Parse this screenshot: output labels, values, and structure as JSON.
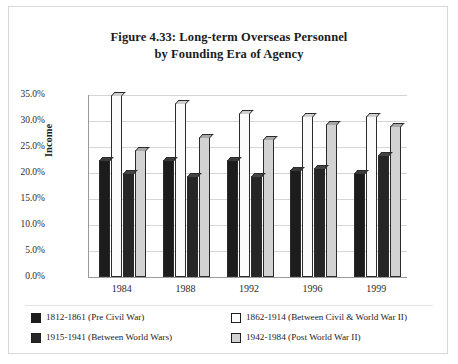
{
  "figure": {
    "title_line1": "Figure 4.33: Long-term Overseas Personnel",
    "title_line2": "by Founding Era of Agency"
  },
  "chart_data": {
    "type": "bar",
    "title": "Figure 4.33: Long-term Overseas Personnel by Founding Era of Agency",
    "xlabel": "",
    "ylabel": "Income",
    "ylim": [
      0,
      35
    ],
    "ytick_labels": [
      "0.0%",
      "5.0%",
      "10.0%",
      "15.0%",
      "20.0%",
      "25.0%",
      "30.0%",
      "35.0%"
    ],
    "ytick_values": [
      0,
      5,
      10,
      15,
      20,
      25,
      30,
      35
    ],
    "grid": true,
    "legend_position": "bottom",
    "categories": [
      "1984",
      "1988",
      "1992",
      "1996",
      "1999"
    ],
    "series": [
      {
        "name": "1812-1861 (Pre Civil War)",
        "color": "#1c1c1c",
        "values": [
          22.5,
          22.5,
          22.5,
          20.5,
          20.0
        ]
      },
      {
        "name": "1862-1914 (Between Civil & World War II)",
        "color": "#fbfbfb",
        "values": [
          35.0,
          33.5,
          31.5,
          31.0,
          31.0
        ]
      },
      {
        "name": "1915-1941 (Between World Wars)",
        "color": "#262626",
        "values": [
          20.0,
          19.5,
          19.5,
          21.0,
          23.5
        ]
      },
      {
        "name": "1942-1984 (Post World War II)",
        "color": "#d2d2d2",
        "values": [
          24.5,
          27.0,
          26.5,
          29.5,
          29.0
        ]
      }
    ]
  }
}
